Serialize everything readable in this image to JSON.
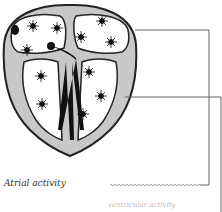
{
  "diagram": {
    "labels": {
      "atrial_activity": "Atrial activity",
      "cut_off_label": "ventricular activity"
    },
    "colors": {
      "outline": "#222222",
      "wall": "#c8c8c8",
      "chamber": "#ffffff",
      "conduction": "#111111",
      "leader_line": "#666666"
    }
  }
}
